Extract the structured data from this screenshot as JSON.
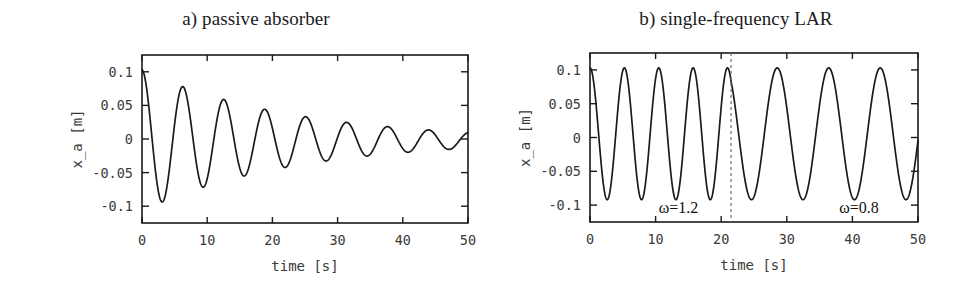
{
  "figure": {
    "background_color": "#ffffff",
    "line_color": "#1a1a1a",
    "dashed_line_color": "#6d6d6d"
  },
  "panels": [
    {
      "id": "a",
      "title": "a) passive absorber",
      "xlabel": "time [s]",
      "ylabel": "x_a [m]",
      "xticks": [
        "0",
        "10",
        "20",
        "30",
        "40",
        "50"
      ],
      "yticks": [
        "0.1",
        "0.05",
        "0",
        "-0.05",
        "-0.1"
      ]
    },
    {
      "id": "b",
      "title": "b) single-frequency LAR",
      "xlabel": "time [s]",
      "ylabel": "x_a [m]",
      "xticks": [
        "0",
        "10",
        "20",
        "30",
        "40",
        "50"
      ],
      "yticks": [
        "0.1",
        "0.05",
        "0",
        "-0.05",
        "-0.1"
      ],
      "annotations": [
        {
          "text": "ω=1.2",
          "x": 13.5,
          "y": -0.112
        },
        {
          "text": "ω=0.8",
          "x": 41.0,
          "y": -0.112
        }
      ]
    }
  ],
  "chart_data": [
    {
      "type": "line",
      "panel": "a",
      "title": "a) passive absorber",
      "xlabel": "time [s]",
      "ylabel": "x_a [m]",
      "xlim": [
        0,
        50
      ],
      "ylim": [
        -0.125,
        0.125
      ],
      "xticks": [
        0,
        10,
        20,
        30,
        40,
        50
      ],
      "yticks": [
        0.1,
        0.05,
        0,
        -0.05,
        -0.1
      ],
      "grid": false,
      "legend": "none",
      "description": "Damped free oscillation of absorber displacement decaying from about 0.105 m to about 0.012 m over 50 s.",
      "model": {
        "form": "A0*exp(-zeta*t)*cos(omega*t)+offset",
        "A0": 0.105,
        "zeta": 0.0435,
        "omega": 1.0,
        "phase": 0.0,
        "offset": -0.002
      },
      "series": [
        {
          "name": "x_a passive",
          "x": [
            0,
            1.6,
            3.3,
            4.9,
            6.6,
            8.1,
            9.7,
            11.3,
            12.9,
            14.5,
            16.1,
            17.7,
            19.3,
            20.9,
            22.5,
            24.1,
            25.7,
            27.3,
            28.9,
            30.5,
            32.1,
            33.7,
            35.3,
            36.9,
            38.5,
            40.1,
            41.7,
            43.3,
            44.9,
            46.5,
            48.1,
            50.0
          ],
          "y": [
            0.105,
            0.0,
            -0.083,
            0.0,
            0.077,
            0.0,
            -0.059,
            0.0,
            0.064,
            0.0,
            -0.046,
            0.0,
            0.052,
            0.0,
            -0.035,
            0.0,
            0.039,
            0.0,
            -0.026,
            0.0,
            0.03,
            0.0,
            -0.019,
            0.0,
            0.024,
            0.0,
            -0.015,
            0.0,
            0.019,
            0.0,
            -0.012,
            0.012
          ]
        }
      ],
      "peaks": [
        {
          "t": 0.0,
          "value": 0.105
        },
        {
          "t": 6.6,
          "value": 0.077
        },
        {
          "t": 12.9,
          "value": 0.064
        },
        {
          "t": 19.3,
          "value": 0.052
        },
        {
          "t": 25.7,
          "value": 0.039
        },
        {
          "t": 32.1,
          "value": 0.03
        },
        {
          "t": 38.5,
          "value": 0.024
        },
        {
          "t": 44.9,
          "value": 0.019
        }
      ],
      "troughs": [
        {
          "t": 3.3,
          "value": -0.083
        },
        {
          "t": 9.7,
          "value": -0.059
        },
        {
          "t": 16.1,
          "value": -0.046
        },
        {
          "t": 22.5,
          "value": -0.035
        },
        {
          "t": 28.9,
          "value": -0.026
        },
        {
          "t": 35.3,
          "value": -0.019
        },
        {
          "t": 41.7,
          "value": -0.015
        },
        {
          "t": 48.1,
          "value": -0.012
        }
      ]
    },
    {
      "type": "line",
      "panel": "b",
      "title": "b) single-frequency LAR",
      "xlabel": "time [s]",
      "ylabel": "x_a [m]",
      "xlim": [
        0,
        50
      ],
      "ylim": [
        -0.125,
        0.125
      ],
      "xticks": [
        0,
        10,
        20,
        30,
        40,
        50
      ],
      "yticks": [
        0.1,
        0.05,
        0,
        -0.05,
        -0.1
      ],
      "grid": false,
      "legend": "none",
      "description": "Sustained limit-cycle oscillation at constant amplitude; excitation frequency switches from omega=1.2 rad/s to omega=0.8 rad/s at t about 21.5 s (dashed vertical line).",
      "switch_time": 21.5,
      "segments": [
        {
          "label": "ω=1.2",
          "omega": 1.2,
          "t_start": 0.0,
          "t_end": 21.5,
          "period": 5.24,
          "amplitude_pos": 0.103,
          "amplitude_neg": -0.092
        },
        {
          "label": "ω=0.8",
          "omega": 0.8,
          "t_start": 21.5,
          "t_end": 50.0,
          "period": 7.85,
          "amplitude_pos": 0.103,
          "amplitude_neg": -0.092
        }
      ],
      "series": [
        {
          "name": "x_a single-frequency LAR",
          "peaks_t": [
            0.0,
            5.4,
            10.7,
            16.1,
            21.5,
            29.1,
            36.9,
            44.8
          ],
          "peaks_y": [
            0.103,
            0.103,
            0.103,
            0.103,
            0.103,
            0.103,
            0.103,
            0.103
          ],
          "troughs_t": [
            2.8,
            8.1,
            13.4,
            18.8,
            25.3,
            33.1,
            40.9,
            48.7
          ],
          "troughs_y": [
            -0.092,
            -0.092,
            -0.092,
            -0.092,
            -0.092,
            -0.092,
            -0.092,
            -0.092
          ]
        }
      ]
    }
  ]
}
